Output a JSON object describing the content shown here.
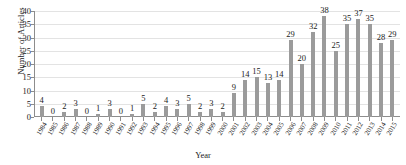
{
  "chart_data": {
    "type": "bar",
    "title": "",
    "xlabel": "Year",
    "ylabel": "Number of Articles",
    "ylim": [
      0,
      40
    ],
    "ytick_step": 5,
    "yticks": [
      0,
      5,
      10,
      15,
      20,
      25,
      30,
      35,
      40
    ],
    "grid": true,
    "legend": null,
    "bar_color": "#9b9b9b",
    "gridline_color": "#e3e3e3",
    "axis_color": "#8d8d8d",
    "text_color": "#1b1b1b",
    "categories": [
      "1984",
      "1985",
      "1986",
      "1987",
      "1988",
      "1989",
      "1990",
      "1991",
      "1992",
      "1993",
      "1994",
      "1995",
      "1996",
      "1997",
      "1998",
      "1999",
      "2000",
      "2001",
      "2002",
      "2003",
      "2004",
      "2005",
      "2006",
      "2007",
      "2008",
      "2009",
      "2010",
      "2011",
      "2012",
      "2013",
      "2014",
      "2015"
    ],
    "values": [
      4,
      0,
      2,
      3,
      0,
      1,
      3,
      0,
      1,
      5,
      2,
      4,
      3,
      5,
      2,
      3,
      2,
      9,
      14,
      15,
      13,
      14,
      29,
      20,
      32,
      38,
      25,
      35,
      37,
      35,
      28,
      29
    ],
    "data_labels": [
      "4",
      "0",
      "2",
      "3",
      "0",
      "1",
      "3",
      "0",
      "1",
      "5",
      "2",
      "4",
      "3",
      "5",
      "2",
      "3",
      "2",
      "9",
      "14",
      "15",
      "13",
      "14",
      "29",
      "20",
      "32",
      "38",
      "25",
      "35",
      "37",
      "35",
      "28",
      "29"
    ]
  }
}
